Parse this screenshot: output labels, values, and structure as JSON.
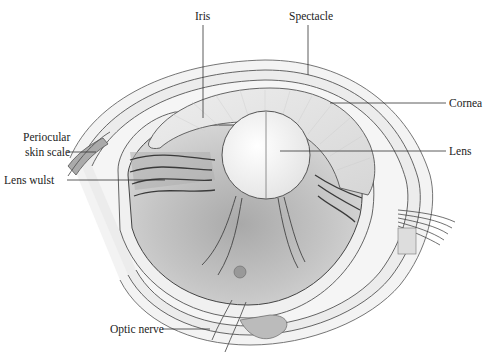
{
  "figure": {
    "labels": {
      "iris": "Iris",
      "spectacle": "Spectacle",
      "cornea": "Cornea",
      "periocular_line1": "Periocular",
      "periocular_line2": "skin scale",
      "lens": "Lens",
      "lens_wulst": "Lens wulst",
      "optic_nerve": "Optic nerve"
    },
    "colors": {
      "background": "#ffffff",
      "line": "#444444",
      "fill_light": "#ededed",
      "fill_vitreous": "#b8b8b8",
      "lens": "#f6f6f6"
    }
  }
}
